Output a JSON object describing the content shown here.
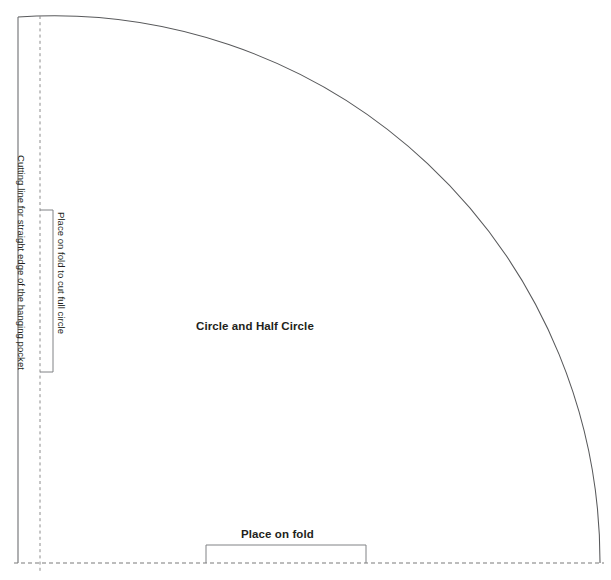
{
  "diagram": {
    "type": "sewing-pattern",
    "title": "Circle and Half Circle",
    "shape": "quarter-circle",
    "background_color": "#ffffff",
    "labels": {
      "center": "Circle and Half Circle",
      "bottom_fold": "Place on fold",
      "side_fold": "Place on fold to cut full circle",
      "cutting_line": "Cutting line for straight edge of the hanging pocket"
    },
    "lines": {
      "arc_color": "#58595b",
      "solid_edge_color": "#6d6e71",
      "dashed_color": "#8c8c8c",
      "bracket_color": "#808285"
    },
    "geometry": {
      "arc_center_x": 18,
      "arc_center_y": 563,
      "arc_radius": 546,
      "left_edge_x": 18,
      "bottom_edge_y": 563,
      "fold_dash_x": 40,
      "bottom_bracket_left": 206,
      "bottom_bracket_right": 366,
      "bottom_bracket_top": 545,
      "side_bracket_top": 210,
      "side_bracket_bottom": 372,
      "side_bracket_x": 53
    }
  }
}
